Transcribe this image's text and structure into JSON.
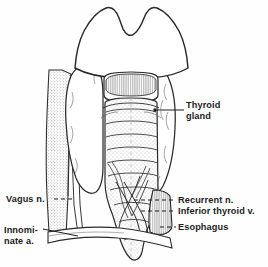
{
  "figure": {
    "style": "pen-and-ink line drawing with stipple shading",
    "background_color": "#fefefe",
    "ink_color": "#1d1d1d",
    "stipple_color": "#6e6e6e",
    "label_text_color": "#1d1d1d"
  },
  "labels": {
    "thyroid_gland": {
      "line1": "Thyroid",
      "line2": "gland",
      "full": "Thyroid gland",
      "side": "right",
      "has_dot_marker": true
    },
    "recurrent_n": {
      "text": "Recurrent n.",
      "full": "Recurrent nerve",
      "side": "right",
      "leader": "dashed"
    },
    "inferior_thyroid_v": {
      "text": "Inferior thyroid v.",
      "full": "Inferior thyroid vein",
      "side": "right",
      "leader": "dashed"
    },
    "esophagus": {
      "text": "Esophagus",
      "full": "Esophagus",
      "side": "right",
      "leader": "dashed"
    },
    "vagus_n": {
      "text": "Vagus n.",
      "full": "Vagus nerve",
      "side": "left",
      "leader": "dashed"
    },
    "innominate_a": {
      "line1": "Innomi-",
      "line2": "nate a.",
      "full": "Innominate artery",
      "side": "left",
      "leader": "solid"
    }
  },
  "anatomy_parts": [
    {
      "name": "thyroid-cartilage",
      "region": "top-center",
      "shaded": false
    },
    {
      "name": "cricoid-cartilage",
      "region": "upper-center",
      "shaded": true
    },
    {
      "name": "thyroid-lobe-left",
      "region": "upper-left",
      "shaded": false
    },
    {
      "name": "thyroid-lobe-right",
      "region": "upper-right",
      "shaded": false
    },
    {
      "name": "trachea",
      "region": "center",
      "shaded": true
    },
    {
      "name": "carotid-artery",
      "region": "left-band",
      "shaded": true
    },
    {
      "name": "vagus-nerve",
      "region": "left",
      "shaded": false
    },
    {
      "name": "recurrent-nerve",
      "region": "lower-center",
      "shaded": false
    },
    {
      "name": "inferior-thyroid-vein",
      "region": "lower-center",
      "shaded": false
    },
    {
      "name": "esophagus",
      "region": "lower-right",
      "shaded": true
    },
    {
      "name": "innominate-artery",
      "region": "lower-left",
      "shaded": false
    }
  ]
}
